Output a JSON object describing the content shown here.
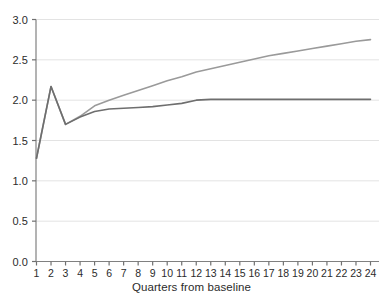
{
  "chart_data": {
    "type": "line",
    "title": "",
    "xlabel": "Quarters from baseline",
    "ylabel": "",
    "xlim": [
      1,
      24
    ],
    "ylim": [
      0.0,
      3.0
    ],
    "grid": true,
    "legend": "none",
    "x": [
      1,
      2,
      3,
      4,
      5,
      6,
      7,
      8,
      9,
      10,
      11,
      12,
      13,
      14,
      15,
      16,
      17,
      18,
      19,
      20,
      21,
      22,
      23,
      24
    ],
    "xticklabels": [
      "1",
      "2",
      "3",
      "4",
      "5",
      "6",
      "7",
      "8",
      "9",
      "10",
      "11",
      "12",
      "13",
      "14",
      "15",
      "16",
      "17",
      "18",
      "19",
      "20",
      "21",
      "22",
      "23",
      "24"
    ],
    "yticklabels": [
      "0.0",
      "0.5",
      "1.0",
      "1.5",
      "2.0",
      "2.5",
      "3.0"
    ],
    "yticks": [
      0.0,
      0.5,
      1.0,
      1.5,
      2.0,
      2.5,
      3.0
    ],
    "series": [
      {
        "name": "upper-line",
        "color": "#9a9a9a",
        "values": [
          1.28,
          2.17,
          1.7,
          1.8,
          1.93,
          2.0,
          2.06,
          2.12,
          2.18,
          2.24,
          2.29,
          2.35,
          2.39,
          2.43,
          2.47,
          2.51,
          2.55,
          2.58,
          2.61,
          2.64,
          2.67,
          2.7,
          2.73,
          2.75
        ]
      },
      {
        "name": "lower-line",
        "color": "#6e6e6e",
        "values": [
          1.28,
          2.17,
          1.7,
          1.79,
          1.86,
          1.89,
          1.9,
          1.91,
          1.92,
          1.94,
          1.96,
          2.0,
          2.01,
          2.01,
          2.01,
          2.01,
          2.01,
          2.01,
          2.01,
          2.01,
          2.01,
          2.01,
          2.01,
          2.01
        ]
      }
    ]
  },
  "axes": {
    "spine_color": "#808080",
    "gridline_color": "#e3e3e3",
    "tick_color": "#707070",
    "label_color": "#2b2b2b"
  }
}
